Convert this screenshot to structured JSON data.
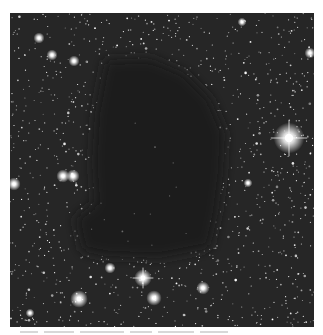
{
  "image": {
    "subject": "dark nebula silhouetted against dense starfield",
    "frame": {
      "x": 10,
      "y": 13,
      "width": 304,
      "height": 314
    },
    "colors": {
      "page_background": "#ffffff",
      "sky_background": "#262626",
      "cloud_color": "#1c1c1c",
      "star_color": "#ffffff"
    },
    "dark_cloud": {
      "outline": [
        [
          95,
          47
        ],
        [
          140,
          45
        ],
        [
          175,
          60
        ],
        [
          200,
          85
        ],
        [
          215,
          120
        ],
        [
          213,
          160
        ],
        [
          208,
          200
        ],
        [
          200,
          235
        ],
        [
          150,
          245
        ],
        [
          95,
          243
        ],
        [
          72,
          238
        ],
        [
          65,
          205
        ],
        [
          85,
          190
        ],
        [
          82,
          150
        ],
        [
          85,
          100
        ]
      ]
    },
    "bright_stars": [
      {
        "x": 279,
        "y": 125,
        "r": 7,
        "spikes": true
      },
      {
        "x": 133,
        "y": 265,
        "r": 4,
        "spikes": true
      },
      {
        "x": 69,
        "y": 286,
        "r": 4,
        "spikes": false
      },
      {
        "x": 144,
        "y": 285,
        "r": 3.5,
        "spikes": false
      },
      {
        "x": 193,
        "y": 275,
        "r": 3,
        "spikes": false
      },
      {
        "x": 100,
        "y": 255,
        "r": 2.5,
        "spikes": false
      },
      {
        "x": 53,
        "y": 163,
        "r": 3,
        "spikes": false
      },
      {
        "x": 63,
        "y": 163,
        "r": 3,
        "spikes": false
      },
      {
        "x": 4,
        "y": 171,
        "r": 3,
        "spikes": false
      },
      {
        "x": 42,
        "y": 42,
        "r": 2.5,
        "spikes": false
      },
      {
        "x": 29,
        "y": 25,
        "r": 2.5,
        "spikes": false
      },
      {
        "x": 64,
        "y": 48,
        "r": 2.5,
        "spikes": false
      },
      {
        "x": 232,
        "y": 9,
        "r": 2,
        "spikes": false
      },
      {
        "x": 300,
        "y": 40,
        "r": 2.5,
        "spikes": false
      },
      {
        "x": 238,
        "y": 170,
        "r": 2,
        "spikes": false
      },
      {
        "x": 20,
        "y": 300,
        "r": 2,
        "spikes": false
      }
    ],
    "field_star_count": 1400,
    "caption": {
      "visible": "partially clipped at bottom edge",
      "text": ""
    }
  }
}
